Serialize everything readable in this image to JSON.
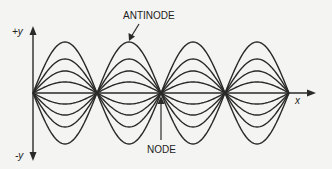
{
  "diagram": {
    "labels": {
      "antinode": "ANTINODE",
      "node": "NODE",
      "y_pos": "+y",
      "y_neg": "-y",
      "x_axis": "x"
    },
    "colors": {
      "background": "#f4f4f2",
      "line": "#2a2a2a"
    },
    "geometry": {
      "axis_y": 93,
      "origin_x": 33,
      "node_spacing": 64,
      "loops": 4,
      "amplitudes": [
        51,
        34,
        22,
        11
      ]
    }
  }
}
